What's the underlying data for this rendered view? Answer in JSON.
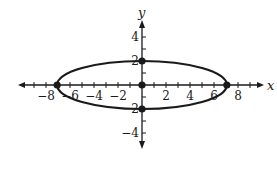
{
  "chart_data": {
    "type": "scatter",
    "title": "",
    "xlabel": "x",
    "ylabel": "y",
    "xlim": [
      -9.5,
      10
    ],
    "ylim": [
      -5,
      5.2
    ],
    "grid": false,
    "curve": {
      "shape": "ellipse",
      "center": [
        0,
        0
      ],
      "semi_major_x": 7.07,
      "semi_minor_y": 2
    },
    "points": [
      {
        "x": -7.07,
        "y": 0
      },
      {
        "x": 7.07,
        "y": 0
      },
      {
        "x": 0,
        "y": 2
      },
      {
        "x": 0,
        "y": -2
      },
      {
        "x": 0,
        "y": 0
      }
    ],
    "x_tick_labels": [
      "-8",
      "-6",
      "-4",
      "-2",
      "2",
      "4",
      "6",
      "8"
    ],
    "y_tick_labels": [
      "4",
      "2",
      "-2",
      "-4"
    ]
  },
  "labels": {
    "x_axis": "x",
    "y_axis": "y",
    "x_ticks": [
      {
        "v": -8,
        "text": "−8"
      },
      {
        "v": -6,
        "text": "−6"
      },
      {
        "v": -4,
        "text": "−4"
      },
      {
        "v": -2,
        "text": "−2"
      },
      {
        "v": 2,
        "text": "2"
      },
      {
        "v": 4,
        "text": "4"
      },
      {
        "v": 6,
        "text": "6"
      },
      {
        "v": 8,
        "text": "8"
      }
    ],
    "y_ticks": [
      {
        "v": 4,
        "text": "4"
      },
      {
        "v": 2,
        "text": "2"
      },
      {
        "v": -2,
        "text": "2"
      },
      {
        "v": -4,
        "text": "−4"
      }
    ]
  },
  "colors": {
    "ink": "#1a1a1a",
    "background": "#ffffff"
  }
}
